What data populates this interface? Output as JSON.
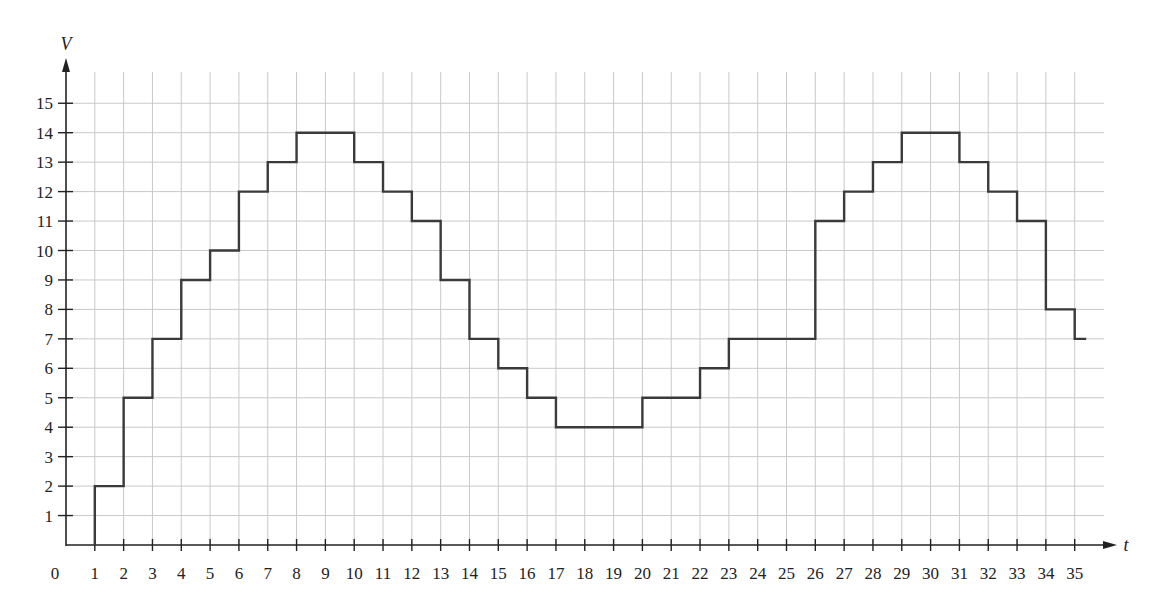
{
  "chart_data": {
    "type": "line",
    "subtype": "step",
    "title": "",
    "xlabel": "t",
    "ylabel": "V",
    "origin_label": "0",
    "xlim": [
      0,
      36
    ],
    "ylim": [
      0,
      16
    ],
    "grid": true,
    "legend": null,
    "x_ticks": [
      1,
      2,
      3,
      4,
      5,
      6,
      7,
      8,
      9,
      10,
      11,
      12,
      13,
      14,
      15,
      16,
      17,
      18,
      19,
      20,
      21,
      22,
      23,
      24,
      25,
      26,
      27,
      28,
      29,
      30,
      31,
      32,
      33,
      34,
      35
    ],
    "y_ticks": [
      1,
      2,
      3,
      4,
      5,
      6,
      7,
      8,
      9,
      10,
      11,
      12,
      13,
      14,
      15
    ],
    "series": [
      {
        "name": "V(t)",
        "color": "#3a3a3a",
        "start": {
          "t": 1,
          "V": 0
        },
        "steps": [
          {
            "t_start": 1,
            "t_end": 2,
            "V": 2
          },
          {
            "t_start": 2,
            "t_end": 3,
            "V": 5
          },
          {
            "t_start": 3,
            "t_end": 4,
            "V": 7
          },
          {
            "t_start": 4,
            "t_end": 5,
            "V": 9
          },
          {
            "t_start": 5,
            "t_end": 6,
            "V": 10
          },
          {
            "t_start": 6,
            "t_end": 7,
            "V": 12
          },
          {
            "t_start": 7,
            "t_end": 8,
            "V": 13
          },
          {
            "t_start": 8,
            "t_end": 10,
            "V": 14
          },
          {
            "t_start": 10,
            "t_end": 11,
            "V": 13
          },
          {
            "t_start": 11,
            "t_end": 12,
            "V": 12
          },
          {
            "t_start": 12,
            "t_end": 13,
            "V": 11
          },
          {
            "t_start": 13,
            "t_end": 14,
            "V": 9
          },
          {
            "t_start": 14,
            "t_end": 15,
            "V": 7
          },
          {
            "t_start": 15,
            "t_end": 16,
            "V": 6
          },
          {
            "t_start": 16,
            "t_end": 17,
            "V": 5
          },
          {
            "t_start": 17,
            "t_end": 20,
            "V": 4
          },
          {
            "t_start": 20,
            "t_end": 22,
            "V": 5
          },
          {
            "t_start": 22,
            "t_end": 23,
            "V": 6
          },
          {
            "t_start": 23,
            "t_end": 26,
            "V": 7
          },
          {
            "t_start": 26,
            "t_end": 27,
            "V": 11
          },
          {
            "t_start": 27,
            "t_end": 28,
            "V": 12
          },
          {
            "t_start": 28,
            "t_end": 29,
            "V": 13
          },
          {
            "t_start": 29,
            "t_end": 31,
            "V": 14
          },
          {
            "t_start": 31,
            "t_end": 32,
            "V": 13
          },
          {
            "t_start": 32,
            "t_end": 33,
            "V": 12
          },
          {
            "t_start": 33,
            "t_end": 34,
            "V": 11
          },
          {
            "t_start": 34,
            "t_end": 35,
            "V": 8
          },
          {
            "t_start": 35,
            "t_end": 35.4,
            "V": 7
          }
        ]
      }
    ]
  }
}
